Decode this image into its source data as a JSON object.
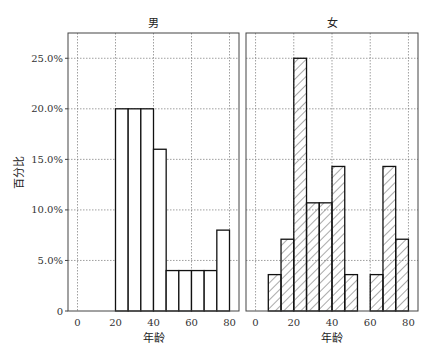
{
  "chart_data": [
    {
      "type": "bar",
      "title": "男",
      "xlabel": "年龄",
      "ylabel": "百分比",
      "bin_edges": [
        20,
        26.67,
        33.33,
        40,
        46.67,
        53.33,
        60,
        66.67,
        73.33,
        80
      ],
      "values": [
        20.0,
        20.0,
        20.0,
        16.0,
        4.0,
        4.0,
        4.0,
        4.0,
        8.0
      ],
      "xlim": [
        -5,
        85
      ],
      "ylim": [
        0,
        27.5
      ],
      "xticks": [
        "0",
        "20",
        "40",
        "60",
        "80"
      ],
      "yticks": [
        "0",
        "5.0%",
        "10.0%",
        "15.0%",
        "20.0%",
        "25.0%"
      ],
      "fill": "none",
      "grid": true
    },
    {
      "type": "bar",
      "title": "女",
      "xlabel": "年龄",
      "ylabel": "",
      "bin_edges": [
        6.67,
        13.33,
        20,
        26.67,
        33.33,
        40,
        46.67,
        53.33,
        60,
        66.67,
        73.33,
        80
      ],
      "values": [
        3.6,
        7.1,
        25.0,
        10.7,
        10.7,
        14.3,
        3.6,
        0,
        3.6,
        14.3,
        7.1
      ],
      "xlim": [
        -5,
        85
      ],
      "ylim": [
        0,
        27.5
      ],
      "xticks": [
        "0",
        "20",
        "40",
        "60",
        "80"
      ],
      "fill": "hatch",
      "grid": true
    }
  ],
  "labels": {
    "male_title": "男",
    "female_title": "女",
    "xlabel": "年龄",
    "ylabel": "百分比"
  }
}
